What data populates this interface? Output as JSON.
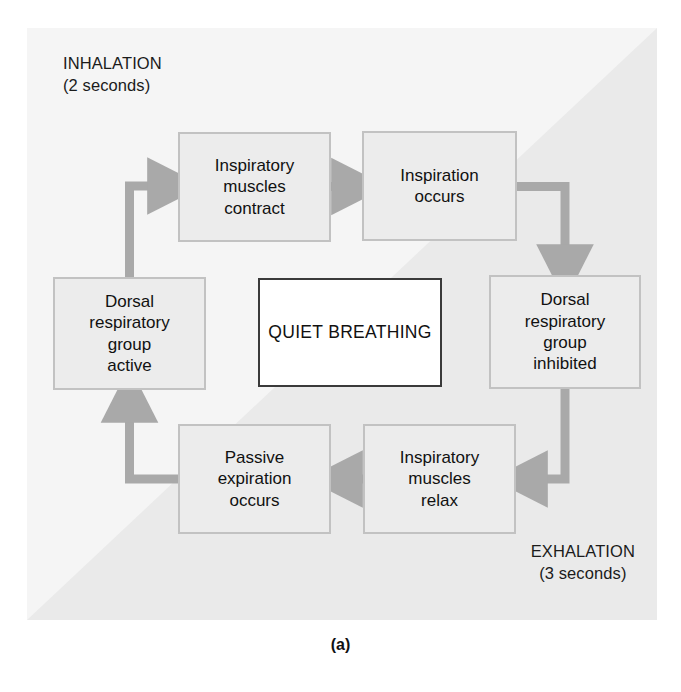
{
  "figure": {
    "caption": "(a)",
    "colors": {
      "panel_background": "#f5f5f5",
      "shaded_half": "#eaeaea",
      "box_fill": "#ececec",
      "box_border": "#c2c2c2",
      "center_box_fill": "#ffffff",
      "center_box_border": "#3a3a3a",
      "arrow": "#a9a9a9",
      "text": "#111111"
    }
  },
  "phases": {
    "inhalation": {
      "name": "INHALATION",
      "duration": "(2 seconds)"
    },
    "exhalation": {
      "name": "EXHALATION",
      "duration": "(3 seconds)"
    }
  },
  "center": {
    "line1": "QUIET",
    "line2": "BREATHING"
  },
  "boxes": [
    {
      "id": "insp-contract",
      "lines": [
        "Inspiratory",
        "muscles",
        "contract"
      ]
    },
    {
      "id": "inspiration",
      "lines": [
        "Inspiration",
        "occurs"
      ]
    },
    {
      "id": "drg-inhibited",
      "lines": [
        "Dorsal",
        "respiratory",
        "group",
        "inhibited"
      ]
    },
    {
      "id": "insp-relax",
      "lines": [
        "Inspiratory",
        "muscles",
        "relax"
      ]
    },
    {
      "id": "passive-exp",
      "lines": [
        "Passive",
        "expiration",
        "occurs"
      ]
    },
    {
      "id": "drg-active",
      "lines": [
        "Dorsal",
        "respiratory",
        "group",
        "active"
      ]
    }
  ],
  "arrows": [
    {
      "name": "drg-active-to-insp-contract",
      "from": "drg-active",
      "to": "insp-contract"
    },
    {
      "name": "insp-contract-to-inspiration",
      "from": "insp-contract",
      "to": "inspiration"
    },
    {
      "name": "inspiration-to-drg-inhibited",
      "from": "inspiration",
      "to": "drg-inhibited"
    },
    {
      "name": "drg-inhibited-to-insp-relax",
      "from": "drg-inhibited",
      "to": "insp-relax"
    },
    {
      "name": "insp-relax-to-passive-exp",
      "from": "insp-relax",
      "to": "passive-exp"
    },
    {
      "name": "passive-exp-to-drg-active",
      "from": "passive-exp",
      "to": "drg-active"
    }
  ]
}
